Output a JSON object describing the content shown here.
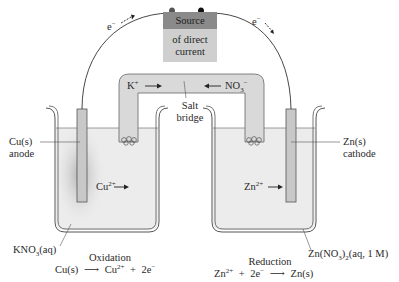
{
  "diagram": {
    "type": "electrolytic-cell",
    "power_source": {
      "line1": "Source",
      "line2": "of direct",
      "line3": "current"
    },
    "electron_flow": {
      "left": {
        "symbol": "e",
        "charge": "−"
      },
      "right": {
        "symbol": "e",
        "charge": "−"
      }
    },
    "salt_bridge": {
      "label_line1": "Salt",
      "label_line2": "bridge",
      "cation": {
        "symbol": "K",
        "charge": "+"
      },
      "anion": {
        "symbol": "NO",
        "subscript": "3",
        "charge": "−"
      }
    },
    "left_cell": {
      "electrode_label_line1": "Cu(s)",
      "electrode_label_line2": "anode",
      "ion": {
        "symbol": "Cu",
        "charge": "2+"
      },
      "solution": {
        "prefix": "KNO",
        "subscript": "3",
        "suffix": "(aq)"
      },
      "process": "Oxidation",
      "equation": {
        "reactant": "Cu(s)",
        "product_ion": "Cu",
        "product_charge": "2+",
        "plus": "+",
        "electrons": "2e",
        "electron_charge": "−"
      }
    },
    "right_cell": {
      "electrode_label_line1": "Zn(s)",
      "electrode_label_line2": "cathode",
      "ion": {
        "symbol": "Zn",
        "charge": "2+"
      },
      "solution": {
        "prefix": "Zn(NO",
        "subscript1": "3",
        "mid": ")",
        "subscript2": "2",
        "suffix": "(aq, 1 M)"
      },
      "process": "Reduction",
      "equation": {
        "reactant_ion": "Zn",
        "reactant_charge": "2+",
        "plus": "+",
        "electrons": "2e",
        "electron_charge": "−",
        "product": "Zn(s)"
      }
    },
    "arrow_glyph": "⟶",
    "colors": {
      "beaker_outline": "#555555",
      "solution": "#ececec",
      "electrode": "#c8c8c8",
      "bridge": "#d9d9d9",
      "source_top": "#8a8a8a",
      "source_bottom": "#cfcfcf",
      "wire": "#333333"
    }
  }
}
